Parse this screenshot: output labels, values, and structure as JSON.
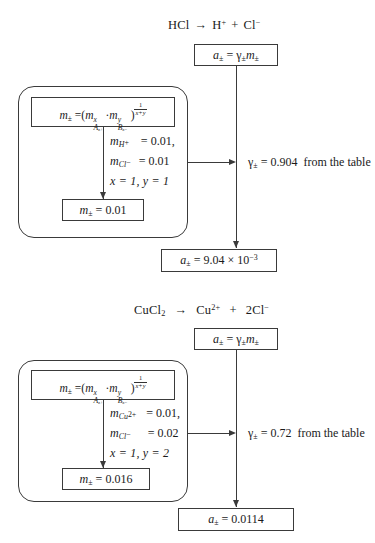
{
  "figure": {
    "background": "#ffffff",
    "line_color": "#3a3a3a"
  },
  "blocks": [
    {
      "id": "hcl",
      "reaction": {
        "reactant": "HCl",
        "arrow": "→",
        "cation": "H",
        "cation_charge": "+",
        "plus": "+",
        "anion": "Cl",
        "anion_charge": "−",
        "anion_coefficient": ""
      },
      "activity_box": {
        "lhs": "a",
        "lhs_sub": "±",
        "eq": "=",
        "gamma": "γ",
        "gamma_sub": "±",
        "m": "m",
        "m_sub": "±"
      },
      "formula_box": {
        "lhs": "m",
        "lhs_sub": "±",
        "eq": "=",
        "open": "(",
        "term1_base": "m",
        "term1_sub": "A",
        "term1_sub2": "z+",
        "term1_sup": "x",
        "dot": "·",
        "term2_base": "m",
        "term2_sub": "B",
        "term2_sub2": "z−",
        "term2_sup": "y",
        "close": ")",
        "exp_num": "1",
        "exp_den": "x+y"
      },
      "params": [
        {
          "symbol": "m",
          "sub": "H",
          "sub_charge": "+",
          "eq": "=",
          "value": "0.01,"
        },
        {
          "symbol": "m",
          "sub": "Cl",
          "sub_charge": "−",
          "eq": "=",
          "value": "0.01"
        }
      ],
      "xy": "x = 1,  y = 1",
      "result_box": {
        "lhs": "m",
        "lhs_sub": "±",
        "eq": "=",
        "value": "0.01"
      },
      "gamma_note": {
        "gamma": "γ",
        "gamma_sub": "±",
        "eq": "=",
        "value": "0.904",
        "source": "from the table"
      },
      "final_box": {
        "lhs": "a",
        "lhs_sub": "±",
        "eq": "=",
        "mantissa": "9.04",
        "times": "×",
        "base": "10",
        "exponent": "−3",
        "value_plain": ""
      }
    },
    {
      "id": "cucl2",
      "reaction": {
        "reactant": "CuCl",
        "reactant_sub": "2",
        "arrow": "→",
        "cation": "Cu",
        "cation_charge": "2+",
        "plus": "+",
        "anion": "Cl",
        "anion_charge": "−",
        "anion_coefficient": "2"
      },
      "activity_box": {
        "lhs": "a",
        "lhs_sub": "±",
        "eq": "=",
        "gamma": "γ",
        "gamma_sub": "±",
        "m": "m",
        "m_sub": "±"
      },
      "formula_box": {
        "lhs": "m",
        "lhs_sub": "±",
        "eq": "=",
        "open": "(",
        "term1_base": "m",
        "term1_sub": "A",
        "term1_sub2": "z+",
        "term1_sup": "x",
        "dot": "·",
        "term2_base": "m",
        "term2_sub": "B",
        "term2_sub2": "z−",
        "term2_sup": "y",
        "close": ")",
        "exp_num": "1",
        "exp_den": "x+y"
      },
      "params": [
        {
          "symbol": "m",
          "sub": "Cu",
          "sub_charge": "2+",
          "eq": "=",
          "value": "0.01,"
        },
        {
          "symbol": "m",
          "sub": "Cl",
          "sub_charge": "−",
          "eq": "=",
          "value": "0.02"
        }
      ],
      "xy": "x = 1,  y = 2",
      "result_box": {
        "lhs": "m",
        "lhs_sub": "±",
        "eq": "=",
        "value": "0.016"
      },
      "gamma_note": {
        "gamma": "γ",
        "gamma_sub": "±",
        "eq": "=",
        "value": "0.72",
        "source": "from the table"
      },
      "final_box": {
        "lhs": "a",
        "lhs_sub": "±",
        "eq": "=",
        "mantissa": "",
        "times": "",
        "base": "",
        "exponent": "",
        "value_plain": "0.0114"
      }
    }
  ]
}
